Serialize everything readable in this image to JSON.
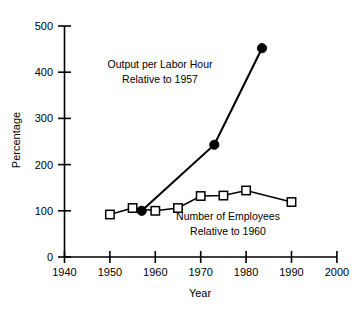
{
  "chart_data": {
    "type": "line",
    "title": "",
    "xlabel": "Year",
    "ylabel": "Percentage",
    "xlim": [
      1940,
      2000
    ],
    "ylim": [
      0,
      500
    ],
    "xticks": [
      1940,
      1950,
      1960,
      1970,
      1980,
      1990,
      2000
    ],
    "yticks": [
      0,
      100,
      200,
      300,
      400,
      500
    ],
    "xtick_labels": [
      "1940",
      "1950",
      "1960",
      "1970",
      "1980",
      "1990",
      "2000"
    ],
    "ytick_labels": [
      "0",
      "100",
      "200",
      "300",
      "400",
      "500"
    ],
    "grid": false,
    "legend_position": "inline-annotations",
    "series": [
      {
        "name": "Output per Labor Hour Relative to 1957",
        "marker": "filled-circle",
        "x": [
          1957,
          1973,
          1983.5
        ],
        "values": [
          100,
          243,
          452
        ]
      },
      {
        "name": "Number of Employees Relative to 1960",
        "marker": "open-square",
        "x": [
          1950,
          1955,
          1960,
          1965,
          1970,
          1975,
          1980,
          1990
        ],
        "values": [
          92,
          106,
          100,
          106,
          132,
          133,
          144,
          119
        ]
      }
    ],
    "annotations": [
      {
        "id": "output-annotation",
        "line1": "Output per Labor Hour",
        "line2": "Relative to 1957",
        "x": 1960.5,
        "y": 395
      },
      {
        "id": "employees-annotation",
        "line1": "Number of Employees",
        "line2": "Relative to 1960",
        "x": 1975.0,
        "y": 82
      }
    ]
  },
  "axes": {
    "y_title": "Percentage",
    "x_title": "Year"
  }
}
